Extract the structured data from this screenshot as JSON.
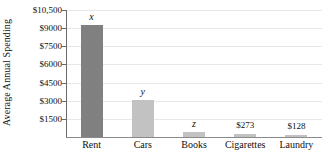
{
  "chart_data": {
    "type": "bar",
    "title": "",
    "xlabel": "",
    "ylabel": "Average Annual Spending",
    "categories": [
      "Rent",
      "Cars",
      "Books",
      "Cigarettes",
      "Laundry"
    ],
    "values": [
      9300,
      3050,
      400,
      273,
      128
    ],
    "point_labels": [
      "x",
      "y",
      "z",
      "$273",
      "$128"
    ],
    "bar_colors": [
      "#808080",
      "#c2c2c2",
      "#c2c2c2",
      "#c2c2c2",
      "#c2c2c2"
    ],
    "ylim": [
      0,
      10500
    ],
    "yticks": [
      1500,
      3000,
      4500,
      6000,
      7500,
      9000,
      10500
    ],
    "ytick_labels": [
      "$1500",
      "$3000",
      "$4500",
      "$6000",
      "$7500",
      "$9000",
      "$10,500"
    ],
    "grid": true,
    "legend": null,
    "legend_position": "none",
    "axis_color": "#6a6a6a",
    "gridline_color": "#e8e8e8"
  },
  "axis": {
    "y_title": "Average Annual Spending"
  }
}
